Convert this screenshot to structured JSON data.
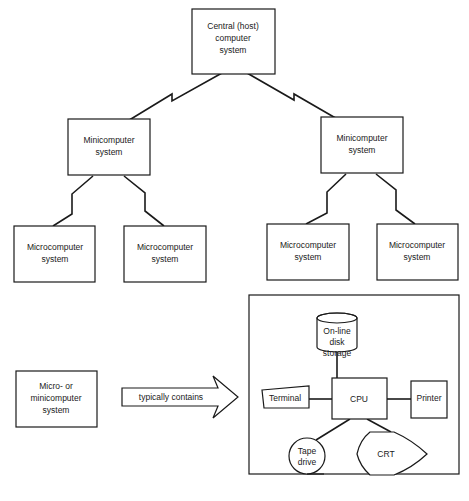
{
  "diagram": {
    "hierarchy": {
      "host": {
        "lines": [
          "Central (host)",
          "computer",
          "system"
        ]
      },
      "minis": [
        {
          "lines": [
            "Minicomputer",
            "system"
          ]
        },
        {
          "lines": [
            "Minicomputer",
            "system"
          ]
        }
      ],
      "micros": [
        {
          "lines": [
            "Microcomputer",
            "system"
          ]
        },
        {
          "lines": [
            "Microcomputer",
            "system"
          ]
        },
        {
          "lines": [
            "Microcomputer",
            "system"
          ]
        },
        {
          "lines": [
            "Microcomputer",
            "system"
          ]
        }
      ]
    },
    "legend": {
      "system_box": {
        "lines": [
          "Micro- or",
          "minicomputer",
          "system"
        ]
      },
      "arrow_label": "typically contains",
      "components": {
        "disk": {
          "lines": [
            "On-line",
            "disk",
            "storage"
          ]
        },
        "cpu": "CPU",
        "terminal": "Terminal",
        "printer": "Printer",
        "tape": {
          "lines": [
            "Tape",
            "drive"
          ]
        },
        "crt": "CRT"
      }
    }
  }
}
